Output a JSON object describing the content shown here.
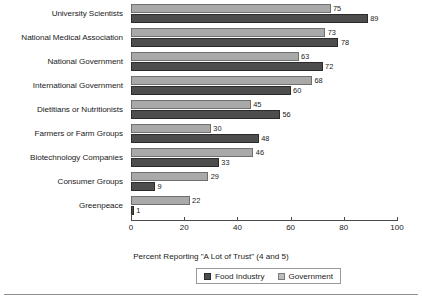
{
  "chart_data": {
    "type": "bar",
    "orientation": "horizontal",
    "title": "",
    "xlabel": "Percent Reporting \"A Lot of Trust\" (4 and 5)",
    "ylabel": "",
    "xlim": [
      0,
      100
    ],
    "xticks": [
      0,
      20,
      40,
      60,
      80,
      100
    ],
    "grid": false,
    "legend_position": "bottom",
    "categories": [
      "University Scientists",
      "National Medical Association",
      "National Government",
      "International Government",
      "Dietitians or Nutritionists",
      "Farmers or Farm Groups",
      "Biotechnology Companies",
      "Consumer Groups",
      "Greenpeace"
    ],
    "series": [
      {
        "name": "Government",
        "color": "#a9a9a9",
        "values": [
          75,
          73,
          63,
          68,
          45,
          30,
          46,
          29,
          22
        ]
      },
      {
        "name": "Food Industry",
        "color": "#4d4d4d",
        "values": [
          89,
          78,
          72,
          60,
          56,
          48,
          33,
          9,
          1
        ]
      }
    ]
  },
  "legend": {
    "items": [
      {
        "label": "Food Industry",
        "swatch": "food"
      },
      {
        "label": "Government",
        "swatch": "govt"
      }
    ]
  }
}
